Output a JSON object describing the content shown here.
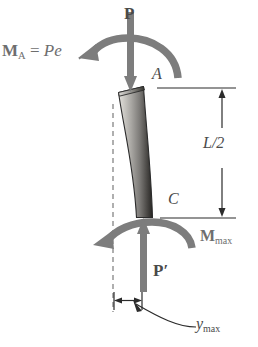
{
  "figure": {
    "colors": {
      "label_gray": "#6e6e6e",
      "label_dark": "#4a4a4a",
      "arrow_gray": "#7d7d7d",
      "line_black": "#2b2b2b",
      "bar_light": "#d8d6d2",
      "bar_dark": "#2e2e2e"
    }
  },
  "labels": {
    "moment_top": {
      "symbol": "M",
      "subscript": "A",
      "equals": " = ",
      "expression": "Pe"
    },
    "load_top": "P",
    "point_a": "A",
    "length_half": "L/2",
    "point_c": "C",
    "moment_max": {
      "symbol": "M",
      "subscript": "max"
    },
    "load_bottom": "P′",
    "deflection_max": {
      "symbol": "y",
      "subscript": "max"
    }
  },
  "geometry": {
    "column_top_x": 131,
    "column_top_y": 88,
    "column_bottom_x": 143,
    "column_bottom_y": 218,
    "centerline_x": 113,
    "centerline_top_y": 104,
    "centerline_bottom_y": 312,
    "dimension_line_x": 222,
    "extension_top_y": 88,
    "extension_bottom_y": 218,
    "deflection_dim_y": 300,
    "deflection_left_x": 114,
    "deflection_right_x": 142
  }
}
